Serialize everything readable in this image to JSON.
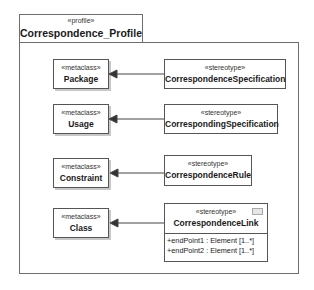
{
  "profile": {
    "stereotype": "«profile»",
    "name": "Correspondence_Profile"
  },
  "metaclasses": [
    {
      "stereotype": "«metaclass»",
      "name": "Package"
    },
    {
      "stereotype": "«metaclass»",
      "name": "Usage"
    },
    {
      "stereotype": "«metaclass»",
      "name": "Constraint"
    },
    {
      "stereotype": "«metaclass»",
      "name": "Class"
    }
  ],
  "stereotypes": [
    {
      "stereotype": "«stereotype»",
      "name": "CorrespondenceSpecification"
    },
    {
      "stereotype": "«stereotype»",
      "name": "CorrespondingSpecification"
    },
    {
      "stereotype": "«stereotype»",
      "name": "CorrespondenceRule"
    },
    {
      "stereotype": "«stereotype»",
      "name": "CorrespondenceLink",
      "icon": "stereotype-icon",
      "attributes": [
        "+endPoint1 : Element [1..*]",
        "+endPoint2 : Element [1..*]"
      ]
    }
  ],
  "relations": [
    {
      "from": "CorrespondenceSpecification",
      "to": "Package",
      "type": "extension"
    },
    {
      "from": "CorrespondingSpecification",
      "to": "Usage",
      "type": "extension"
    },
    {
      "from": "CorrespondenceRule",
      "to": "Constraint",
      "type": "extension"
    },
    {
      "from": "CorrespondenceLink",
      "to": "Class",
      "type": "extension"
    }
  ]
}
